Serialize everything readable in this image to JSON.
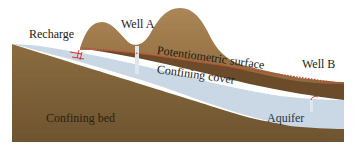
{
  "diagram": {
    "labels": {
      "recharge": "Recharge",
      "well_a": "Well A",
      "potentiometric_surface": "Potentiometric surface",
      "well_b": "Well B",
      "confining_cover": "Confining cover",
      "confining_bed": "Confining bed",
      "aquifer": "Aquifer"
    },
    "colors": {
      "background": "#ffffff",
      "confining_bed": "#7a5e36",
      "aquifer": "#c9d8e4",
      "confining_cover": "#6b4b2a",
      "hills": "#a27d50",
      "potentiometric_line": "#d8372e",
      "label_text": "#1e1a14",
      "aquifer_text": "#1f3446"
    }
  }
}
